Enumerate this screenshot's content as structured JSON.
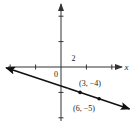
{
  "chart_data": {
    "type": "line",
    "title": "",
    "xlabel": "x",
    "ylabel": "",
    "origin_label": "0",
    "x_tick_label": "2",
    "tick_step": 2,
    "xlim": [
      -16,
      20
    ],
    "ylim": [
      -16,
      18
    ],
    "grid": false,
    "legend": null,
    "line": {
      "equation": "y = -x/3 - 3",
      "slope": -0.3333,
      "y_intercept": -3,
      "arrows_both_ends": true
    },
    "points": [
      {
        "x": 3,
        "y": -4,
        "label": "(3, −4)"
      },
      {
        "x": 6,
        "y": -5,
        "label": "(6, −5)"
      }
    ],
    "x_ticks": [
      -16,
      -12,
      -8,
      -4,
      0,
      4,
      8,
      12,
      16
    ],
    "y_ticks": [
      16,
      12,
      8,
      4,
      0,
      -4,
      -8,
      -12,
      -16
    ]
  },
  "colors": {
    "axis": "#333333",
    "line": "#111111",
    "text": "#222222"
  }
}
